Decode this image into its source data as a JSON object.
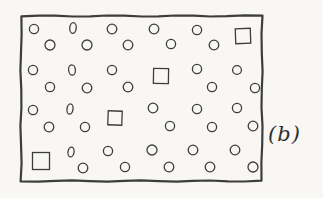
{
  "figure": {
    "label": "(b)",
    "stroke_color": "#3d3d3d",
    "paper_color": "#f8f7f4",
    "border": {
      "x": 21,
      "y": 16,
      "width": 241,
      "height": 165,
      "stroke_width": 2.2
    },
    "shape_stroke_width": 1.3,
    "shapes": [
      {
        "type": "circle",
        "cx": 34,
        "cy": 29,
        "r": 4.6
      },
      {
        "type": "ellipse",
        "cx": 73,
        "cy": 28,
        "rx": 3.2,
        "ry": 5.4,
        "rot": 6
      },
      {
        "type": "circle",
        "cx": 112,
        "cy": 29,
        "r": 4.8
      },
      {
        "type": "circle",
        "cx": 154,
        "cy": 29,
        "r": 4.8
      },
      {
        "type": "circle",
        "cx": 197,
        "cy": 30,
        "r": 4.6
      },
      {
        "type": "square",
        "cx": 243,
        "cy": 36,
        "size": 15,
        "rot": -2
      },
      {
        "type": "circle",
        "cx": 50,
        "cy": 45,
        "r": 5.0
      },
      {
        "type": "circle",
        "cx": 87,
        "cy": 45,
        "r": 5.0
      },
      {
        "type": "circle",
        "cx": 128,
        "cy": 45,
        "r": 4.8
      },
      {
        "type": "circle",
        "cx": 171,
        "cy": 44,
        "r": 4.6
      },
      {
        "type": "circle",
        "cx": 214,
        "cy": 45,
        "r": 4.8
      },
      {
        "type": "circle",
        "cx": 33,
        "cy": 70,
        "r": 4.6
      },
      {
        "type": "ellipse",
        "cx": 72,
        "cy": 70,
        "rx": 3.4,
        "ry": 5.2,
        "rot": -5
      },
      {
        "type": "circle",
        "cx": 112,
        "cy": 70,
        "r": 4.6
      },
      {
        "type": "square",
        "cx": 161,
        "cy": 76,
        "size": 15,
        "rot": 1
      },
      {
        "type": "circle",
        "cx": 197,
        "cy": 69,
        "r": 4.6
      },
      {
        "type": "circle",
        "cx": 237,
        "cy": 70,
        "r": 4.4
      },
      {
        "type": "circle",
        "cx": 50,
        "cy": 87,
        "r": 4.6
      },
      {
        "type": "circle",
        "cx": 87,
        "cy": 88,
        "r": 4.8
      },
      {
        "type": "circle",
        "cx": 128,
        "cy": 87,
        "r": 4.8
      },
      {
        "type": "circle",
        "cx": 212,
        "cy": 87,
        "r": 4.6
      },
      {
        "type": "circle",
        "cx": 255,
        "cy": 88,
        "r": 4.6
      },
      {
        "type": "circle",
        "cx": 33,
        "cy": 110,
        "r": 4.6
      },
      {
        "type": "ellipse",
        "cx": 70,
        "cy": 109,
        "rx": 3.0,
        "ry": 5.2,
        "rot": 7
      },
      {
        "type": "square",
        "cx": 115,
        "cy": 118,
        "size": 14,
        "rot": 2
      },
      {
        "type": "circle",
        "cx": 153,
        "cy": 108,
        "r": 4.8
      },
      {
        "type": "circle",
        "cx": 197,
        "cy": 109,
        "r": 4.6
      },
      {
        "type": "circle",
        "cx": 237,
        "cy": 108,
        "r": 4.6
      },
      {
        "type": "circle",
        "cx": 49,
        "cy": 127,
        "r": 4.8
      },
      {
        "type": "circle",
        "cx": 85,
        "cy": 127,
        "r": 4.6
      },
      {
        "type": "circle",
        "cx": 170,
        "cy": 126,
        "r": 4.6
      },
      {
        "type": "circle",
        "cx": 212,
        "cy": 127,
        "r": 4.6
      },
      {
        "type": "circle",
        "cx": 253,
        "cy": 126,
        "r": 4.8
      },
      {
        "type": "square",
        "cx": 41,
        "cy": 161,
        "size": 17,
        "rot": 0
      },
      {
        "type": "ellipse",
        "cx": 71,
        "cy": 152,
        "rx": 3.0,
        "ry": 5.0,
        "rot": 10
      },
      {
        "type": "circle",
        "cx": 108,
        "cy": 151,
        "r": 4.6
      },
      {
        "type": "circle",
        "cx": 152,
        "cy": 150,
        "r": 5.0
      },
      {
        "type": "circle",
        "cx": 193,
        "cy": 150,
        "r": 4.8
      },
      {
        "type": "circle",
        "cx": 235,
        "cy": 150,
        "r": 4.8
      },
      {
        "type": "circle",
        "cx": 83,
        "cy": 168,
        "r": 4.8
      },
      {
        "type": "circle",
        "cx": 125,
        "cy": 167,
        "r": 4.6
      },
      {
        "type": "circle",
        "cx": 169,
        "cy": 167,
        "r": 4.8
      },
      {
        "type": "circle",
        "cx": 210,
        "cy": 167,
        "r": 4.8
      },
      {
        "type": "circle",
        "cx": 253,
        "cy": 167,
        "r": 5.0
      }
    ]
  }
}
